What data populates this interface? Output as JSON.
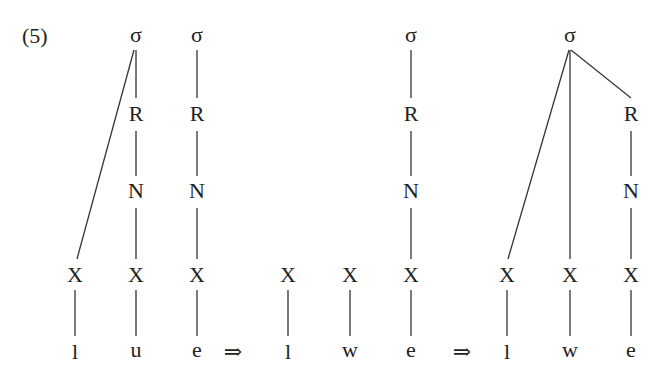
{
  "example_number": "(5)",
  "arrow_symbol": "⇒",
  "stages": [
    {
      "name": "input",
      "syllables": [
        {
          "label": "σ",
          "x": 136,
          "y": 35
        },
        {
          "label": "σ",
          "x": 197,
          "y": 35
        }
      ],
      "rimes": [
        {
          "label": "R",
          "x": 136,
          "y": 114
        },
        {
          "label": "R",
          "x": 197,
          "y": 114
        }
      ],
      "nuclei": [
        {
          "label": "N",
          "x": 136,
          "y": 191
        },
        {
          "label": "N",
          "x": 197,
          "y": 191
        }
      ],
      "skeleton": [
        {
          "label": "X",
          "x": 75,
          "y": 275
        },
        {
          "label": "X",
          "x": 136,
          "y": 275
        },
        {
          "label": "X",
          "x": 197,
          "y": 275
        }
      ],
      "segments": [
        {
          "label": "l",
          "x": 75,
          "y": 352
        },
        {
          "label": "u",
          "x": 136,
          "y": 352
        },
        {
          "label": "e",
          "x": 197,
          "y": 352
        }
      ]
    },
    {
      "name": "intermediate",
      "syllables": [
        {
          "label": "σ",
          "x": 411,
          "y": 35
        }
      ],
      "rimes": [
        {
          "label": "R",
          "x": 411,
          "y": 114
        }
      ],
      "nuclei": [
        {
          "label": "N",
          "x": 411,
          "y": 191
        }
      ],
      "skeleton": [
        {
          "label": "X",
          "x": 288,
          "y": 275
        },
        {
          "label": "X",
          "x": 350,
          "y": 275
        },
        {
          "label": "X",
          "x": 411,
          "y": 275
        }
      ],
      "segments": [
        {
          "label": "l",
          "x": 288,
          "y": 352
        },
        {
          "label": "w",
          "x": 350,
          "y": 352
        },
        {
          "label": "e",
          "x": 411,
          "y": 352
        }
      ]
    },
    {
      "name": "output",
      "syllables": [
        {
          "label": "σ",
          "x": 570,
          "y": 35
        }
      ],
      "rimes": [
        {
          "label": "R",
          "x": 631,
          "y": 114
        }
      ],
      "nuclei": [
        {
          "label": "N",
          "x": 631,
          "y": 191
        }
      ],
      "skeleton": [
        {
          "label": "X",
          "x": 507,
          "y": 275
        },
        {
          "label": "X",
          "x": 570,
          "y": 275
        },
        {
          "label": "X",
          "x": 631,
          "y": 275
        }
      ],
      "segments": [
        {
          "label": "l",
          "x": 507,
          "y": 352
        },
        {
          "label": "w",
          "x": 570,
          "y": 352
        },
        {
          "label": "e",
          "x": 631,
          "y": 352
        }
      ]
    }
  ],
  "arrows": [
    {
      "label": "⇒",
      "x": 233,
      "y": 352
    },
    {
      "label": "⇒",
      "x": 462,
      "y": 352
    }
  ],
  "edges": [
    {
      "from": "σ1",
      "to": "X-l",
      "x1": 134,
      "y1": 50,
      "x2": 77,
      "y2": 259
    },
    {
      "from": "σ1",
      "to": "R1",
      "x1": 136,
      "y1": 50,
      "x2": 136,
      "y2": 98
    },
    {
      "from": "R1",
      "to": "N1",
      "x1": 136,
      "y1": 131,
      "x2": 136,
      "y2": 176
    },
    {
      "from": "N1",
      "to": "X-u",
      "x1": 136,
      "y1": 208,
      "x2": 136,
      "y2": 259
    },
    {
      "from": "σ2",
      "to": "R2",
      "x1": 197,
      "y1": 50,
      "x2": 197,
      "y2": 98
    },
    {
      "from": "R2",
      "to": "N2",
      "x1": 197,
      "y1": 131,
      "x2": 197,
      "y2": 176
    },
    {
      "from": "N2",
      "to": "X-e",
      "x1": 197,
      "y1": 208,
      "x2": 197,
      "y2": 259
    },
    {
      "from": "X-l",
      "to": "l",
      "x1": 75,
      "y1": 290,
      "x2": 75,
      "y2": 336
    },
    {
      "from": "X-u",
      "to": "u",
      "x1": 136,
      "y1": 290,
      "x2": 136,
      "y2": 336
    },
    {
      "from": "X-e",
      "to": "e",
      "x1": 197,
      "y1": 290,
      "x2": 197,
      "y2": 336
    },
    {
      "from": "σ3",
      "to": "R3",
      "x1": 411,
      "y1": 50,
      "x2": 411,
      "y2": 98
    },
    {
      "from": "R3",
      "to": "N3",
      "x1": 411,
      "y1": 131,
      "x2": 411,
      "y2": 176
    },
    {
      "from": "N3",
      "to": "X-e2",
      "x1": 411,
      "y1": 208,
      "x2": 411,
      "y2": 259
    },
    {
      "from": "X-l2",
      "to": "l2",
      "x1": 288,
      "y1": 290,
      "x2": 288,
      "y2": 336
    },
    {
      "from": "X-w2",
      "to": "w2",
      "x1": 350,
      "y1": 290,
      "x2": 350,
      "y2": 336
    },
    {
      "from": "X-e2",
      "to": "e2",
      "x1": 411,
      "y1": 290,
      "x2": 411,
      "y2": 336
    },
    {
      "from": "σ4",
      "to": "X-l3",
      "x1": 569,
      "y1": 50,
      "x2": 508,
      "y2": 259
    },
    {
      "from": "σ4",
      "to": "X-w3",
      "x1": 570,
      "y1": 50,
      "x2": 570,
      "y2": 259
    },
    {
      "from": "σ4",
      "to": "R4",
      "x1": 571,
      "y1": 50,
      "x2": 631,
      "y2": 98
    },
    {
      "from": "R4",
      "to": "N4",
      "x1": 631,
      "y1": 131,
      "x2": 631,
      "y2": 176
    },
    {
      "from": "N4",
      "to": "X-e3",
      "x1": 631,
      "y1": 208,
      "x2": 631,
      "y2": 259
    },
    {
      "from": "X-l3",
      "to": "l3",
      "x1": 507,
      "y1": 290,
      "x2": 507,
      "y2": 336
    },
    {
      "from": "X-w3",
      "to": "w3",
      "x1": 570,
      "y1": 290,
      "x2": 570,
      "y2": 336
    },
    {
      "from": "X-e3",
      "to": "e3",
      "x1": 631,
      "y1": 290,
      "x2": 631,
      "y2": 336
    }
  ]
}
